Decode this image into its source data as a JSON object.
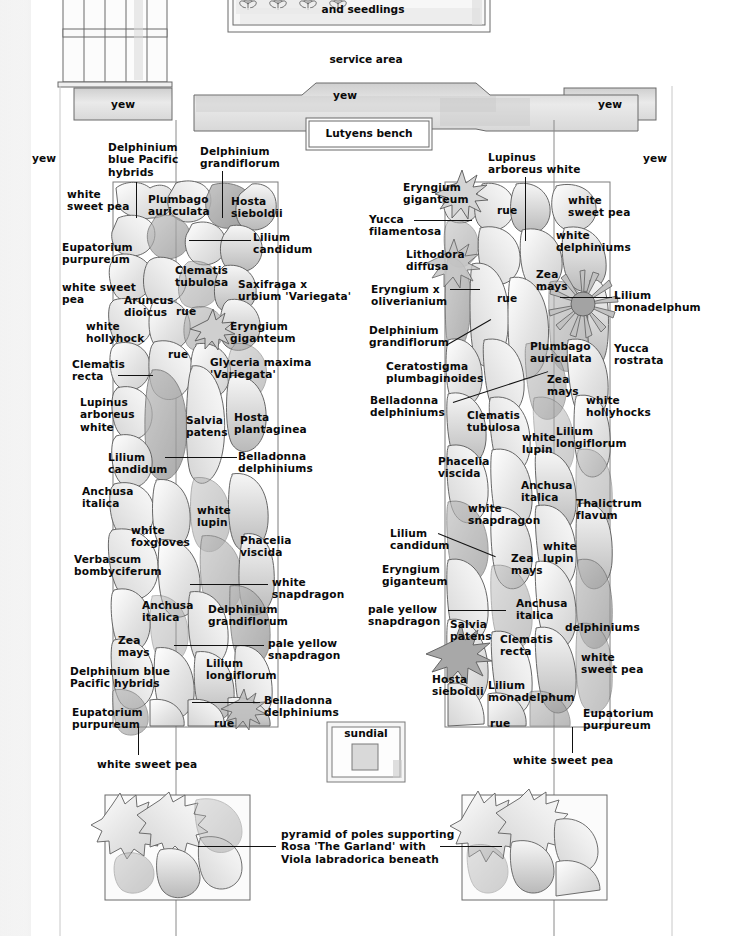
{
  "structures": {
    "seed_house": {
      "label": "and seedlings"
    },
    "service_area": {
      "label": "service area"
    },
    "bench": {
      "label": "Lutyens bench"
    },
    "sundial": {
      "label": "sundial"
    },
    "hedges": [
      {
        "id": "yew-left-block",
        "label": "yew"
      },
      {
        "id": "yew-center-block",
        "label": "yew"
      },
      {
        "id": "yew-right-block",
        "label": "yew"
      },
      {
        "id": "yew-left-edge",
        "label": "yew"
      },
      {
        "id": "yew-right-edge",
        "label": "yew"
      }
    ],
    "pyramid_note": "pyramid of poles supporting\nRosa 'The Garland' with\nViola labradorica beneath"
  },
  "left_border": {
    "name": "left herbaceous border",
    "plants": [
      {
        "id": "l01",
        "label": "Delphinium\nblue Pacific\nhybrids",
        "x": 108,
        "y": 141,
        "align": "left",
        "leader": "v",
        "lx": 136,
        "ly": 182,
        "llen": 36
      },
      {
        "id": "l02",
        "label": "Delphinium\ngrandiflorum",
        "x": 200,
        "y": 145,
        "align": "left",
        "leader": "v",
        "lx": 222,
        "ly": 171,
        "llen": 47
      },
      {
        "id": "l03",
        "label": "white\nsweet pea",
        "x": 67,
        "y": 188,
        "align": "left",
        "leader": "none"
      },
      {
        "id": "l04",
        "label": "Plumbago\nauriculata",
        "x": 148,
        "y": 193,
        "align": "left",
        "leader": "none"
      },
      {
        "id": "l05",
        "label": "Hosta\nsieboldii",
        "x": 231,
        "y": 195,
        "align": "left",
        "leader": "none"
      },
      {
        "id": "l06",
        "label": "Lilium\ncandidum",
        "x": 253,
        "y": 231,
        "align": "left",
        "leader": "h",
        "lx": 189,
        "ly": 240,
        "llen": 62
      },
      {
        "id": "l07",
        "label": "Eupatorium\npurpureum",
        "x": 62,
        "y": 241,
        "align": "left",
        "leader": "none"
      },
      {
        "id": "l08",
        "label": "Clematis\ntubulosa",
        "x": 175,
        "y": 264,
        "align": "left",
        "leader": "none"
      },
      {
        "id": "l09",
        "label": "Saxifraga x\nurbium 'Variegata'",
        "x": 238,
        "y": 278,
        "align": "left",
        "leader": "none"
      },
      {
        "id": "l10",
        "label": "white sweet\npea",
        "x": 62,
        "y": 281,
        "align": "left",
        "leader": "none"
      },
      {
        "id": "l11",
        "label": "Aruncus\ndioicus",
        "x": 124,
        "y": 294,
        "align": "left",
        "leader": "none"
      },
      {
        "id": "l12",
        "label": "rue",
        "x": 176,
        "y": 305,
        "align": "left",
        "leader": "none"
      },
      {
        "id": "l13",
        "label": "Eryngium\ngiganteum",
        "x": 230,
        "y": 320,
        "align": "left",
        "leader": "none"
      },
      {
        "id": "l14",
        "label": "white\nhollyhock",
        "x": 86,
        "y": 320,
        "align": "left",
        "leader": "none"
      },
      {
        "id": "l15",
        "label": "rue",
        "x": 168,
        "y": 348,
        "align": "left",
        "leader": "none"
      },
      {
        "id": "l16",
        "label": "Glyceria maxima\n'Variegata'",
        "x": 210,
        "y": 356,
        "align": "left",
        "leader": "none"
      },
      {
        "id": "l17",
        "label": "Clematis\nrecta",
        "x": 72,
        "y": 358,
        "align": "left",
        "leader": "h",
        "lx": 118,
        "ly": 375,
        "llen": 35
      },
      {
        "id": "l18",
        "label": "Lupinus\narboreus\nwhite",
        "x": 80,
        "y": 396,
        "align": "left",
        "leader": "none"
      },
      {
        "id": "l19",
        "label": "Salvia\npatens",
        "x": 186,
        "y": 414,
        "align": "left",
        "leader": "none"
      },
      {
        "id": "l20",
        "label": "Hosta\nplantaginea",
        "x": 234,
        "y": 411,
        "align": "left",
        "leader": "none"
      },
      {
        "id": "l21",
        "label": "Belladonna\ndelphiniums",
        "x": 238,
        "y": 450,
        "align": "left",
        "leader": "h",
        "lx": 165,
        "ly": 457,
        "llen": 72
      },
      {
        "id": "l22",
        "label": "Lilium\ncandidum",
        "x": 108,
        "y": 451,
        "align": "left",
        "leader": "none"
      },
      {
        "id": "l23",
        "label": "Anchusa\nitalica",
        "x": 82,
        "y": 485,
        "align": "left",
        "leader": "none"
      },
      {
        "id": "l24",
        "label": "white\nlupin",
        "x": 197,
        "y": 504,
        "align": "left",
        "leader": "none"
      },
      {
        "id": "l25",
        "label": "white\nfoxgloves",
        "x": 131,
        "y": 524,
        "align": "left",
        "leader": "none"
      },
      {
        "id": "l26",
        "label": "Phacelia\nviscida",
        "x": 240,
        "y": 534,
        "align": "left",
        "leader": "none"
      },
      {
        "id": "l27",
        "label": "Verbascum\nbombyciferum",
        "x": 74,
        "y": 553,
        "align": "left",
        "leader": "none"
      },
      {
        "id": "l28",
        "label": "white\nsnapdragon",
        "x": 272,
        "y": 576,
        "align": "left",
        "leader": "h",
        "lx": 190,
        "ly": 584,
        "llen": 78
      },
      {
        "id": "l29",
        "label": "Anchusa\nitalica",
        "x": 142,
        "y": 599,
        "align": "left",
        "leader": "none"
      },
      {
        "id": "l30",
        "label": "Delphinium\ngrandiflorum",
        "x": 208,
        "y": 603,
        "align": "left",
        "leader": "none"
      },
      {
        "id": "l31",
        "label": "pale yellow\nsnapdragon",
        "x": 268,
        "y": 637,
        "align": "left",
        "leader": "h",
        "lx": 174,
        "ly": 645,
        "llen": 90
      },
      {
        "id": "l32",
        "label": "Zea\nmays",
        "x": 118,
        "y": 634,
        "align": "left",
        "leader": "none"
      },
      {
        "id": "l33",
        "label": "Lilium\nlongiflorum",
        "x": 206,
        "y": 657,
        "align": "left",
        "leader": "none"
      },
      {
        "id": "l34",
        "label": "Delphinium blue\nPacific hybrids",
        "x": 70,
        "y": 665,
        "align": "left",
        "leader": "none"
      },
      {
        "id": "l35",
        "label": "Belladonna\ndelphiniums",
        "x": 264,
        "y": 694,
        "align": "left",
        "leader": "h",
        "lx": 192,
        "ly": 702,
        "llen": 68
      },
      {
        "id": "l36",
        "label": "Eupatorium\npurpureum",
        "x": 72,
        "y": 706,
        "align": "left",
        "leader": "none"
      },
      {
        "id": "l37",
        "label": "rue",
        "x": 214,
        "y": 717,
        "align": "left",
        "leader": "none"
      },
      {
        "id": "l38",
        "label": "white sweet pea",
        "x": 97,
        "y": 758,
        "align": "left",
        "leader": "v",
        "lx": 138,
        "ly": 727,
        "llen": 28
      }
    ]
  },
  "right_border": {
    "name": "right herbaceous border",
    "plants": [
      {
        "id": "r01",
        "label": "Lupinus\narboreus white",
        "x": 488,
        "y": 151,
        "align": "left",
        "leader": "v",
        "lx": 525,
        "ly": 177,
        "llen": 64
      },
      {
        "id": "r02",
        "label": "Eryngium\ngiganteum",
        "x": 403,
        "y": 181,
        "align": "left",
        "leader": "none"
      },
      {
        "id": "r03",
        "label": "rue",
        "x": 497,
        "y": 204,
        "align": "left",
        "leader": "none"
      },
      {
        "id": "r04",
        "label": "white\nsweet pea",
        "x": 568,
        "y": 194,
        "align": "left",
        "leader": "none"
      },
      {
        "id": "r05",
        "label": "Yucca\nfilamentosa",
        "x": 369,
        "y": 213,
        "align": "left",
        "leader": "h",
        "lx": 414,
        "ly": 220,
        "llen": 58
      },
      {
        "id": "r06",
        "label": "white\ndelphiniums",
        "x": 556,
        "y": 229,
        "align": "left",
        "leader": "none"
      },
      {
        "id": "r07",
        "label": "Lithodora\ndiffusa",
        "x": 406,
        "y": 248,
        "align": "left",
        "leader": "none"
      },
      {
        "id": "r08",
        "label": "Zea\nmays",
        "x": 536,
        "y": 268,
        "align": "left",
        "leader": "none"
      },
      {
        "id": "r09",
        "label": "Eryngium x\noliverianium",
        "x": 371,
        "y": 283,
        "align": "left",
        "leader": "h",
        "lx": 450,
        "ly": 289,
        "llen": 30
      },
      {
        "id": "r10",
        "label": "rue",
        "x": 497,
        "y": 292,
        "align": "left",
        "leader": "none"
      },
      {
        "id": "r11",
        "label": "Lilium\nmonadelphum",
        "x": 614,
        "y": 289,
        "align": "left",
        "leader": "h",
        "lx": 560,
        "ly": 297,
        "llen": 52
      },
      {
        "id": "r12",
        "label": "Delphinium\ngrandiflorum",
        "x": 369,
        "y": 324,
        "align": "left",
        "leader": "d",
        "lx": 446,
        "ly": 345,
        "llen": 52,
        "lang": -30
      },
      {
        "id": "r13",
        "label": "Plumbago\nauriculata",
        "x": 530,
        "y": 340,
        "align": "left",
        "leader": "none"
      },
      {
        "id": "r14",
        "label": "Yucca\nrostrata",
        "x": 614,
        "y": 342,
        "align": "left",
        "leader": "none"
      },
      {
        "id": "r15",
        "label": "Ceratostigma\nplumbaginoides",
        "x": 386,
        "y": 360,
        "align": "left",
        "leader": "none"
      },
      {
        "id": "r16",
        "label": "Zea\nmays",
        "x": 547,
        "y": 373,
        "align": "left",
        "leader": "d",
        "lx": 453,
        "ly": 402,
        "llen": 100,
        "lang": -18
      },
      {
        "id": "r17",
        "label": "Belladonna\ndelphiniums",
        "x": 370,
        "y": 394,
        "align": "left",
        "leader": "none"
      },
      {
        "id": "r18",
        "label": "white\nhollyhocks",
        "x": 586,
        "y": 394,
        "align": "left",
        "leader": "none"
      },
      {
        "id": "r19",
        "label": "Clematis\ntubulosa",
        "x": 467,
        "y": 409,
        "align": "left",
        "leader": "none"
      },
      {
        "id": "r20",
        "label": "white\nlupin",
        "x": 522,
        "y": 431,
        "align": "left",
        "leader": "none"
      },
      {
        "id": "r21",
        "label": "Lilium\nlongiflorum",
        "x": 556,
        "y": 425,
        "align": "left",
        "leader": "none"
      },
      {
        "id": "r22",
        "label": "Phacelia\nviscida",
        "x": 438,
        "y": 455,
        "align": "left",
        "leader": "none"
      },
      {
        "id": "r23",
        "label": "Anchusa\nitalica",
        "x": 521,
        "y": 479,
        "align": "left",
        "leader": "none"
      },
      {
        "id": "r24",
        "label": "Thalictrum\nflavum",
        "x": 576,
        "y": 497,
        "align": "left",
        "leader": "none"
      },
      {
        "id": "r25",
        "label": "white\nsnapdragon",
        "x": 468,
        "y": 502,
        "align": "left",
        "leader": "none"
      },
      {
        "id": "r26",
        "label": "Lilium\ncandidum",
        "x": 390,
        "y": 527,
        "align": "left",
        "leader": "d",
        "lx": 438,
        "ly": 533,
        "llen": 62,
        "lang": 22
      },
      {
        "id": "r27",
        "label": "Zea\nmays",
        "x": 511,
        "y": 552,
        "align": "left",
        "leader": "none"
      },
      {
        "id": "r28",
        "label": "white\nlupin",
        "x": 543,
        "y": 540,
        "align": "left",
        "leader": "none"
      },
      {
        "id": "r29",
        "label": "Eryngium\ngiganteum",
        "x": 382,
        "y": 563,
        "align": "left",
        "leader": "none"
      },
      {
        "id": "r30",
        "label": "Anchusa\nitalica",
        "x": 516,
        "y": 597,
        "align": "left",
        "leader": "none"
      },
      {
        "id": "r31",
        "label": "pale yellow\nsnapdragon",
        "x": 368,
        "y": 603,
        "align": "left",
        "leader": "h",
        "lx": 448,
        "ly": 610,
        "llen": 58
      },
      {
        "id": "r32",
        "label": "delphiniums",
        "x": 565,
        "y": 621,
        "align": "left",
        "leader": "none"
      },
      {
        "id": "r33",
        "label": "Salvia\npatens",
        "x": 450,
        "y": 618,
        "align": "left",
        "leader": "none"
      },
      {
        "id": "r34",
        "label": "Clematis\nrecta",
        "x": 500,
        "y": 633,
        "align": "left",
        "leader": "none"
      },
      {
        "id": "r35",
        "label": "white\nsweet pea",
        "x": 581,
        "y": 651,
        "align": "left",
        "leader": "none"
      },
      {
        "id": "r36",
        "label": "Hosta\nsieboldii",
        "x": 432,
        "y": 673,
        "align": "left",
        "leader": "none"
      },
      {
        "id": "r37",
        "label": "Lilium\nmonadelphum",
        "x": 488,
        "y": 679,
        "align": "left",
        "leader": "none"
      },
      {
        "id": "r38",
        "label": "Eupatorium\npurpureum",
        "x": 583,
        "y": 707,
        "align": "left",
        "leader": "none"
      },
      {
        "id": "r39",
        "label": "rue",
        "x": 490,
        "y": 717,
        "align": "left",
        "leader": "none"
      },
      {
        "id": "r40",
        "label": "white sweet pea",
        "x": 513,
        "y": 754,
        "align": "left",
        "leader": "v",
        "lx": 572,
        "ly": 727,
        "llen": 26
      }
    ]
  },
  "colors": {
    "ink": "#111111",
    "outline": "#4a4a4a",
    "wash_light": "#e6e6e6",
    "wash_mid": "#c9c9c9",
    "wash_dark": "#a8a8a8",
    "paper": "#ffffff"
  }
}
